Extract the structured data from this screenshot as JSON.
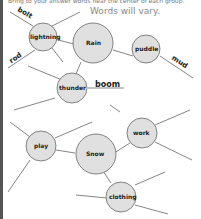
{
  "header": {
    "instruction_cut": "Bring to your answer words near the center of each group.",
    "note": "Words will vary."
  },
  "colors": {
    "circle_fill": "#e0e0e0",
    "stroke": "#555555",
    "text": "#222222"
  },
  "web1": {
    "center": "Rain",
    "nodes": [
      "lightning",
      "puddle",
      "thunder"
    ],
    "written": [
      "bolt",
      "rod",
      "mud",
      "boom"
    ]
  },
  "web2": {
    "center": "Snow",
    "nodes": [
      "play",
      "work",
      "clothing"
    ]
  }
}
